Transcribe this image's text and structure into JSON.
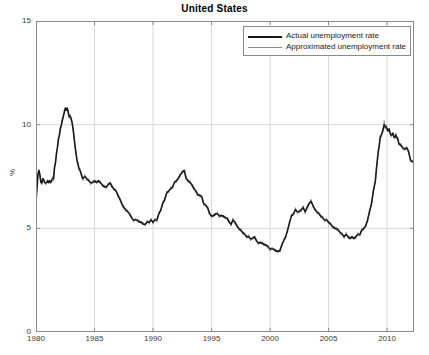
{
  "chart_data": {
    "type": "line",
    "title": "United States",
    "xlabel": "",
    "ylabel": "%",
    "xlim": [
      1980,
      2012.3
    ],
    "ylim": [
      0,
      15
    ],
    "xticks": [
      1980,
      1985,
      1990,
      1995,
      2000,
      2005,
      2010
    ],
    "yticks": [
      0,
      5,
      10,
      15
    ],
    "grid": true,
    "legend_position": "top-right",
    "legend": [
      "Actual unemployment rate",
      "Approximated unemployment rate"
    ],
    "colors": {
      "actual": "#1a1a1a",
      "approximated": "#8c8c8c",
      "axis": "#8a8a8a",
      "grid": "#d8d8d8",
      "background": "#ffffff",
      "text": "#3a3a3a"
    },
    "series": [
      {
        "name": "Actual unemployment rate",
        "color": "#1a1a1a",
        "width": 1.6,
        "x": [
          1980.0,
          1980.08,
          1980.17,
          1980.25,
          1980.33,
          1980.42,
          1980.5,
          1980.58,
          1980.67,
          1980.75,
          1980.83,
          1980.92,
          1981.0,
          1981.08,
          1981.17,
          1981.25,
          1981.33,
          1981.42,
          1981.5,
          1981.58,
          1981.67,
          1981.75,
          1981.83,
          1981.92,
          1982.0,
          1982.08,
          1982.17,
          1982.25,
          1982.33,
          1982.42,
          1982.5,
          1982.58,
          1982.67,
          1982.75,
          1982.83,
          1982.92,
          1983.0,
          1983.08,
          1983.17,
          1983.25,
          1983.33,
          1983.42,
          1983.5,
          1983.58,
          1983.67,
          1983.75,
          1983.83,
          1983.92,
          1984.0,
          1984.17,
          1984.33,
          1984.5,
          1984.67,
          1984.83,
          1985.0,
          1985.17,
          1985.33,
          1985.5,
          1985.67,
          1985.83,
          1986.0,
          1986.17,
          1986.33,
          1986.5,
          1986.67,
          1986.83,
          1987.0,
          1987.17,
          1987.33,
          1987.5,
          1987.67,
          1987.83,
          1988.0,
          1988.17,
          1988.33,
          1988.5,
          1988.67,
          1988.83,
          1989.0,
          1989.17,
          1989.33,
          1989.5,
          1989.67,
          1989.83,
          1990.0,
          1990.17,
          1990.33,
          1990.5,
          1990.67,
          1990.83,
          1991.0,
          1991.17,
          1991.33,
          1991.5,
          1991.67,
          1991.83,
          1992.0,
          1992.17,
          1992.33,
          1992.5,
          1992.67,
          1992.83,
          1993.0,
          1993.17,
          1993.33,
          1993.5,
          1993.67,
          1993.83,
          1994.0,
          1994.17,
          1994.33,
          1994.5,
          1994.67,
          1994.83,
          1995.0,
          1995.17,
          1995.33,
          1995.5,
          1995.67,
          1995.83,
          1996.0,
          1996.17,
          1996.33,
          1996.5,
          1996.67,
          1996.83,
          1997.0,
          1997.17,
          1997.33,
          1997.5,
          1997.67,
          1997.83,
          1998.0,
          1998.17,
          1998.33,
          1998.5,
          1998.67,
          1998.83,
          1999.0,
          1999.17,
          1999.33,
          1999.5,
          1999.67,
          1999.83,
          2000.0,
          2000.17,
          2000.33,
          2000.5,
          2000.67,
          2000.83,
          2001.0,
          2001.17,
          2001.33,
          2001.5,
          2001.67,
          2001.83,
          2002.0,
          2002.17,
          2002.33,
          2002.5,
          2002.67,
          2002.83,
          2003.0,
          2003.17,
          2003.33,
          2003.5,
          2003.67,
          2003.83,
          2004.0,
          2004.17,
          2004.33,
          2004.5,
          2004.67,
          2004.83,
          2005.0,
          2005.17,
          2005.33,
          2005.5,
          2005.67,
          2005.83,
          2006.0,
          2006.17,
          2006.33,
          2006.5,
          2006.67,
          2006.83,
          2007.0,
          2007.17,
          2007.33,
          2007.5,
          2007.67,
          2007.83,
          2008.0,
          2008.17,
          2008.33,
          2008.5,
          2008.67,
          2008.83,
          2009.0,
          2009.08,
          2009.17,
          2009.25,
          2009.33,
          2009.42,
          2009.5,
          2009.58,
          2009.67,
          2009.75,
          2009.83,
          2009.92,
          2010.0,
          2010.08,
          2010.17,
          2010.25,
          2010.33,
          2010.42,
          2010.5,
          2010.58,
          2010.67,
          2010.75,
          2010.83,
          2010.92,
          2011.0,
          2011.17,
          2011.33,
          2011.5,
          2011.67,
          2011.83,
          2012.0,
          2012.17,
          2012.3
        ],
        "y": [
          6.3,
          6.9,
          7.6,
          7.8,
          7.6,
          7.2,
          7.2,
          7.4,
          7.3,
          7.2,
          7.2,
          7.2,
          7.3,
          7.2,
          7.3,
          7.2,
          7.3,
          7.4,
          7.4,
          7.9,
          8.2,
          8.6,
          8.9,
          9.3,
          9.5,
          9.8,
          10.0,
          10.2,
          10.4,
          10.6,
          10.8,
          10.7,
          10.8,
          10.6,
          10.4,
          10.4,
          10.3,
          10.1,
          9.8,
          9.4,
          9.0,
          8.6,
          8.3,
          8.1,
          7.9,
          7.8,
          7.7,
          7.5,
          7.4,
          7.5,
          7.4,
          7.3,
          7.2,
          7.2,
          7.3,
          7.2,
          7.3,
          7.2,
          7.1,
          7.0,
          7.0,
          7.1,
          7.2,
          7.0,
          6.9,
          6.8,
          6.6,
          6.4,
          6.2,
          6.0,
          5.9,
          5.8,
          5.7,
          5.5,
          5.4,
          5.4,
          5.4,
          5.3,
          5.3,
          5.2,
          5.2,
          5.3,
          5.3,
          5.4,
          5.3,
          5.4,
          5.4,
          5.7,
          5.9,
          6.2,
          6.4,
          6.7,
          6.8,
          6.9,
          7.0,
          7.2,
          7.3,
          7.4,
          7.6,
          7.7,
          7.8,
          7.4,
          7.3,
          7.2,
          7.1,
          6.9,
          6.8,
          6.6,
          6.6,
          6.5,
          6.2,
          6.1,
          6.0,
          5.7,
          5.6,
          5.6,
          5.7,
          5.7,
          5.6,
          5.6,
          5.6,
          5.5,
          5.5,
          5.3,
          5.2,
          5.4,
          5.3,
          5.1,
          5.0,
          4.9,
          4.8,
          4.7,
          4.6,
          4.6,
          4.5,
          4.5,
          4.6,
          4.4,
          4.3,
          4.3,
          4.3,
          4.2,
          4.2,
          4.1,
          4.0,
          4.0,
          4.0,
          3.9,
          3.9,
          3.9,
          4.2,
          4.4,
          4.6,
          4.9,
          5.3,
          5.6,
          5.7,
          5.9,
          5.8,
          5.8,
          5.9,
          6.0,
          5.8,
          6.0,
          6.2,
          6.3,
          6.1,
          5.9,
          5.8,
          5.7,
          5.6,
          5.5,
          5.4,
          5.4,
          5.3,
          5.2,
          5.1,
          5.0,
          5.0,
          4.9,
          4.8,
          4.7,
          4.6,
          4.7,
          4.6,
          4.5,
          4.6,
          4.5,
          4.6,
          4.7,
          4.7,
          4.9,
          5.0,
          5.1,
          5.4,
          5.8,
          6.2,
          6.8,
          7.3,
          7.8,
          8.3,
          8.7,
          9.0,
          9.4,
          9.5,
          9.6,
          9.8,
          10.0,
          9.9,
          9.9,
          9.8,
          9.7,
          9.8,
          9.6,
          9.5,
          9.5,
          9.6,
          9.4,
          9.4,
          9.5,
          9.4,
          9.3,
          9.1,
          9.0,
          8.9,
          8.8,
          8.9,
          8.7,
          8.3,
          8.2,
          8.2
        ]
      },
      {
        "name": "Approximated unemployment rate",
        "color": "#8c8c8c",
        "width": 0.9,
        "x": [
          1980.0,
          1980.08,
          1980.17,
          1980.25,
          1980.33,
          1980.42,
          1980.5,
          1980.58,
          1980.67,
          1980.75,
          1980.83,
          1980.92,
          1981.0,
          1981.08,
          1981.17,
          1981.25,
          1981.33,
          1981.42,
          1981.5,
          1981.58,
          1981.67,
          1981.75,
          1981.83,
          1981.92,
          1982.0,
          1982.08,
          1982.17,
          1982.25,
          1982.33,
          1982.42,
          1982.5,
          1982.58,
          1982.67,
          1982.75,
          1982.83,
          1982.92,
          1983.0,
          1983.08,
          1983.17,
          1983.25,
          1983.33,
          1983.42,
          1983.5,
          1983.58,
          1983.67,
          1983.75,
          1983.83,
          1983.92,
          1984.0,
          1984.17,
          1984.33,
          1984.5,
          1984.67,
          1984.83,
          1985.0,
          1985.17,
          1985.33,
          1985.5,
          1985.67,
          1985.83,
          1986.0,
          1986.17,
          1986.33,
          1986.5,
          1986.67,
          1986.83,
          1987.0,
          1987.17,
          1987.33,
          1987.5,
          1987.67,
          1987.83,
          1988.0,
          1988.17,
          1988.33,
          1988.5,
          1988.67,
          1988.83,
          1989.0,
          1989.17,
          1989.33,
          1989.5,
          1989.67,
          1989.83,
          1990.0,
          1990.17,
          1990.33,
          1990.5,
          1990.67,
          1990.83,
          1991.0,
          1991.17,
          1991.33,
          1991.5,
          1991.67,
          1991.83,
          1992.0,
          1992.17,
          1992.33,
          1992.5,
          1992.67,
          1992.83,
          1993.0,
          1993.17,
          1993.33,
          1993.5,
          1993.67,
          1993.83,
          1994.0,
          1994.17,
          1994.33,
          1994.5,
          1994.67,
          1994.83,
          1995.0,
          1995.17,
          1995.33,
          1995.5,
          1995.67,
          1995.83,
          1996.0,
          1996.17,
          1996.33,
          1996.5,
          1996.67,
          1996.83,
          1997.0,
          1997.17,
          1997.33,
          1997.5,
          1997.67,
          1997.83,
          1998.0,
          1998.17,
          1998.33,
          1998.5,
          1998.67,
          1998.83,
          1999.0,
          1999.17,
          1999.33,
          1999.5,
          1999.67,
          1999.83,
          2000.0,
          2000.17,
          2000.33,
          2000.5,
          2000.67,
          2000.83,
          2001.0,
          2001.17,
          2001.33,
          2001.5,
          2001.67,
          2001.83,
          2002.0,
          2002.17,
          2002.33,
          2002.5,
          2002.67,
          2002.83,
          2003.0,
          2003.17,
          2003.33,
          2003.5,
          2003.67,
          2003.83,
          2004.0,
          2004.17,
          2004.33,
          2004.5,
          2004.67,
          2004.83,
          2005.0,
          2005.17,
          2005.33,
          2005.5,
          2005.67,
          2005.83,
          2006.0,
          2006.17,
          2006.33,
          2006.5,
          2006.67,
          2006.83,
          2007.0,
          2007.17,
          2007.33,
          2007.5,
          2007.67,
          2007.83,
          2008.0,
          2008.17,
          2008.33,
          2008.5,
          2008.67,
          2008.83,
          2009.0,
          2009.08,
          2009.17,
          2009.25,
          2009.33,
          2009.42,
          2009.5,
          2009.58,
          2009.67,
          2009.75,
          2009.83,
          2009.92,
          2010.0,
          2010.08,
          2010.17,
          2010.25,
          2010.33,
          2010.42,
          2010.5,
          2010.58,
          2010.67,
          2010.75,
          2010.83,
          2010.92,
          2011.0,
          2011.17,
          2011.33,
          2011.5,
          2011.67,
          2011.83,
          2012.0,
          2012.17,
          2012.3
        ],
        "y": [
          6.5,
          7.0,
          7.7,
          7.7,
          7.5,
          7.3,
          7.1,
          7.3,
          7.4,
          7.2,
          7.1,
          7.3,
          7.2,
          7.3,
          7.2,
          7.3,
          7.2,
          7.5,
          7.3,
          8.0,
          8.1,
          8.7,
          8.8,
          9.4,
          9.4,
          9.9,
          9.9,
          10.3,
          10.3,
          10.7,
          10.7,
          10.8,
          10.7,
          10.7,
          10.3,
          10.5,
          10.2,
          10.2,
          9.7,
          9.5,
          8.9,
          8.7,
          8.2,
          8.2,
          7.8,
          7.9,
          7.6,
          7.6,
          7.3,
          7.6,
          7.3,
          7.4,
          7.1,
          7.3,
          7.2,
          7.3,
          7.2,
          7.3,
          7.0,
          7.1,
          6.9,
          7.2,
          7.1,
          7.1,
          6.8,
          6.9,
          6.5,
          6.5,
          6.1,
          6.1,
          5.8,
          5.9,
          5.6,
          5.6,
          5.3,
          5.5,
          5.3,
          5.4,
          5.2,
          5.3,
          5.1,
          5.4,
          5.2,
          5.5,
          5.2,
          5.5,
          5.3,
          5.8,
          5.8,
          6.3,
          6.3,
          6.8,
          6.7,
          7.0,
          6.9,
          7.3,
          7.2,
          7.5,
          7.5,
          7.8,
          7.7,
          7.5,
          7.2,
          7.3,
          7.0,
          7.0,
          6.7,
          6.7,
          6.5,
          6.6,
          6.1,
          6.2,
          5.9,
          5.8,
          5.5,
          5.7,
          5.6,
          5.8,
          5.5,
          5.7,
          5.5,
          5.6,
          5.4,
          5.4,
          5.1,
          5.5,
          5.2,
          5.2,
          4.9,
          5.0,
          4.7,
          4.8,
          4.5,
          4.7,
          4.4,
          4.6,
          4.5,
          4.5,
          4.2,
          4.4,
          4.2,
          4.3,
          4.1,
          4.2,
          3.9,
          4.1,
          3.9,
          4.0,
          3.8,
          4.0,
          4.1,
          4.5,
          4.5,
          5.0,
          5.2,
          5.7,
          5.6,
          6.0,
          5.7,
          5.9,
          5.8,
          6.1,
          5.7,
          6.1,
          6.1,
          6.4,
          6.0,
          6.0,
          5.7,
          5.8,
          5.5,
          5.6,
          5.3,
          5.5,
          5.2,
          5.3,
          5.0,
          5.1,
          4.9,
          5.0,
          4.7,
          4.8,
          4.5,
          4.8,
          4.5,
          4.6,
          4.5,
          4.6,
          4.5,
          4.8,
          4.6,
          5.0,
          4.9,
          5.2,
          5.3,
          5.9,
          6.1,
          6.9,
          7.2,
          7.9,
          8.2,
          8.8,
          8.9,
          9.5,
          9.4,
          9.7,
          9.7,
          10.2,
          9.8,
          10.0,
          9.7,
          9.8,
          9.7,
          9.7,
          9.4,
          9.6,
          9.5,
          9.5,
          9.3,
          9.6,
          9.3,
          9.4,
          9.0,
          9.1,
          8.8,
          8.9,
          8.8,
          8.8,
          8.2,
          8.3,
          8.1
        ]
      }
    ]
  }
}
